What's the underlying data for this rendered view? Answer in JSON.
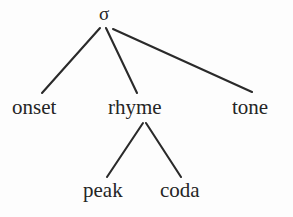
{
  "diagram": {
    "type": "syllable-structure-tree",
    "background_color": "#fdfdfd",
    "line_color": "#2a2a2a",
    "text_color": "#252525",
    "root": {
      "label": "σ",
      "name": "sigma"
    },
    "level_two": [
      {
        "label": "onset"
      },
      {
        "label": "rhyme"
      },
      {
        "label": "tone"
      }
    ],
    "level_three": [
      {
        "label": "peak"
      },
      {
        "label": "coda"
      }
    ],
    "edges": [
      {
        "from": "sigma",
        "to": "onset"
      },
      {
        "from": "sigma",
        "to": "rhyme"
      },
      {
        "from": "sigma",
        "to": "tone"
      },
      {
        "from": "rhyme",
        "to": "peak"
      },
      {
        "from": "rhyme",
        "to": "coda"
      }
    ]
  }
}
